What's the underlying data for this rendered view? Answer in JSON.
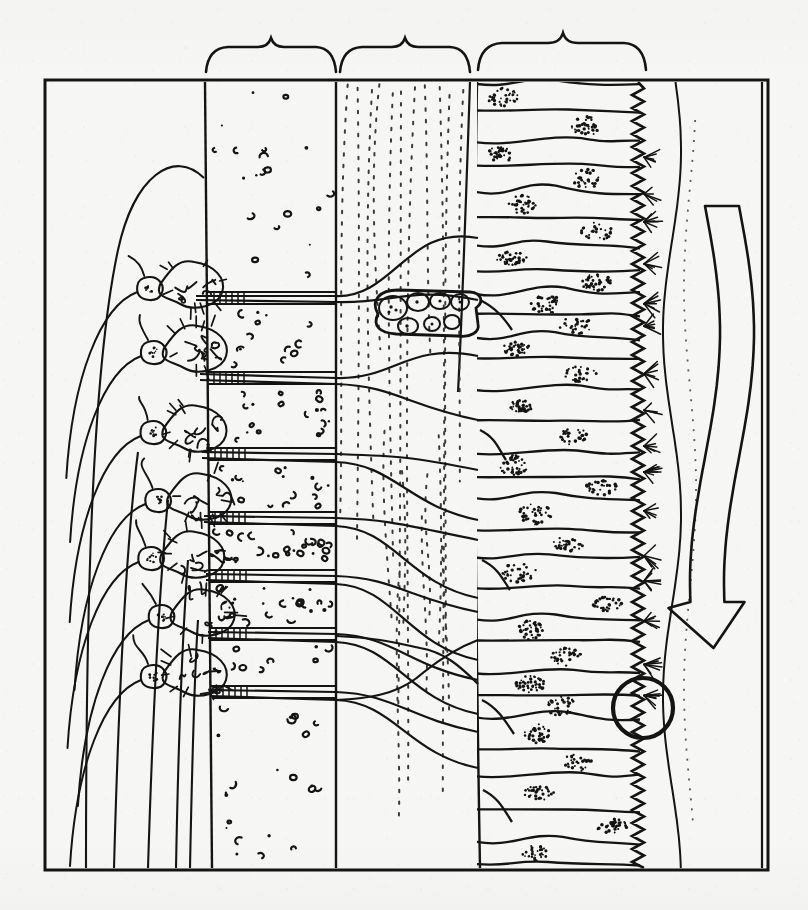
{
  "figure": {
    "caption": "",
    "media": "line drawing, black ink on off-white paper",
    "background_color": "#f6f6f4",
    "ink_color": "#141414",
    "frame": {
      "x": 45,
      "y": 80,
      "width": 723,
      "height": 790,
      "stroke_width": 3
    }
  },
  "braces": [
    {
      "id": "brace-left",
      "label": "",
      "x_start": 205,
      "x_end": 336,
      "y_baseline": 70,
      "tip_y": 36
    },
    {
      "id": "brace-middle",
      "label": "",
      "x_start": 339,
      "x_end": 470,
      "y_baseline": 70,
      "tip_y": 36
    },
    {
      "id": "brace-right",
      "label": "",
      "x_start": 477,
      "x_end": 646,
      "y_baseline": 70,
      "tip_y": 32
    }
  ],
  "zones": [
    {
      "id": "zone-nerve-bundle",
      "name": "olfactory nerve / bundle region",
      "x_range": [
        45,
        205
      ],
      "texture": "long sweeping parallel axon fascicles and an arched outline",
      "elements": "large arch, descending fiber bundles"
    },
    {
      "id": "zone-glomerular-granular",
      "name": "granular / glomerular layer",
      "x_range": [
        205,
        336
      ],
      "texture": "dense scattered comma and crescent shaped stipple marks",
      "speckle_count": 150
    },
    {
      "id": "zone-fiber-dotted",
      "name": "axon / fiber layer",
      "x_range": [
        339,
        470
      ],
      "texture": "faint vertical dotted tracks",
      "dotted_track_count": 11
    },
    {
      "id": "zone-epithelium",
      "name": "sensory epithelium",
      "x_range": [
        477,
        646
      ],
      "texture": "stacked elongate columnar cells with stippled nuclei",
      "cell_count": 30
    },
    {
      "id": "zone-mucus",
      "name": "mucus / lumen layer",
      "x_range": [
        646,
        768
      ],
      "texture": "wavy free surface line and directional flow arrow"
    }
  ],
  "neurons": {
    "count": 7,
    "description": "mitral-type neurons with branching dendritic tufts and a dark stippled nucleus in the soma",
    "soma_y_positions": [
      288,
      352,
      432,
      500,
      558,
      616,
      676
    ]
  },
  "accessory_cell_cluster": {
    "id": "accessory-cell-cluster",
    "name": "small encapsulated receptor cell cluster",
    "x": 372,
    "y": 312,
    "width": 118,
    "height": 42,
    "internal_cell_count": 7
  },
  "callout_circle": {
    "id": "detail-circle",
    "name": "detail highlight circle on the ciliated border",
    "cx": 643,
    "cy": 708,
    "r": 30,
    "stroke_width": 4
  },
  "brush_border": {
    "id": "ciliated-brush-border",
    "name": "zigzag ciliated apical border",
    "x": 638,
    "y_start": 82,
    "y_end": 868,
    "zigzag_amplitude": 6,
    "zigzag_period": 13,
    "cilia_tuft_count": 16
  },
  "flow_arrow": {
    "id": "flow-arrow",
    "name": "wavy directional flow arrow",
    "direction": "downward",
    "x_center": 722,
    "y_start": 206,
    "y_end": 648,
    "style": "outline, unfilled"
  },
  "free_surface_line": {
    "id": "free-surface-line",
    "name": "wavy mucus surface line",
    "x_center": 672,
    "y_start": 82,
    "y_end": 868
  },
  "right_inner_rule": {
    "id": "right-inner-rule",
    "name": "vertical inner rule",
    "x": 762,
    "y_start": 82,
    "y_end": 868
  }
}
